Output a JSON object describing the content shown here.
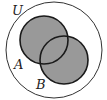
{
  "diagram": {
    "type": "venn",
    "universe": {
      "label": "U",
      "cx": 54,
      "cy": 50,
      "r": 48
    },
    "sets": [
      {
        "label": "A",
        "cx": 44,
        "cy": 40,
        "r": 24,
        "label_x": 14,
        "label_y": 69
      },
      {
        "label": "B",
        "cx": 64,
        "cy": 60,
        "r": 24,
        "label_x": 36,
        "label_y": 89
      }
    ],
    "shaded_region": "A ∪ B",
    "colors": {
      "shade": "#999999",
      "stroke": "#1a1a1a",
      "background": "#ffffff"
    }
  }
}
